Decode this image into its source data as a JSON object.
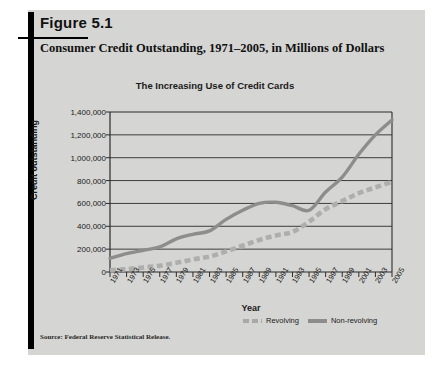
{
  "figure": {
    "label": "Figure 5.1",
    "title": "Consumer Credit Outstanding, 1971–2005, in Millions of Dollars",
    "source": "Source: Federal Reserve Statistical Release."
  },
  "colors": {
    "card_background": "#d5d5d3",
    "non_revolving": "#8d8d8b",
    "revolving": "#aeaeac",
    "axis": "#2b2b2b",
    "text": "#1a1a1a"
  },
  "legend": {
    "position": "bottom-right",
    "entries": [
      {
        "label": "Revolving",
        "style": "dashed"
      },
      {
        "label": "Non-revolving",
        "style": "solid"
      }
    ]
  },
  "chart_data": {
    "type": "line",
    "title": "The Increasing Use of Credit Cards",
    "xlabel": "Year",
    "ylabel": "Credit outstanding",
    "grid": true,
    "ylim": [
      0,
      1400000
    ],
    "ytick_labels": [
      "1,400,000",
      "1,200,000",
      "1,000,000",
      "800,000",
      "600,000",
      "400,000",
      "200,000",
      "0"
    ],
    "ytick_values": [
      1400000,
      1200000,
      1000000,
      800000,
      600000,
      400000,
      200000,
      0
    ],
    "categories": [
      "1971",
      "1973",
      "1975",
      "1977",
      "1979",
      "1981",
      "1983",
      "1985",
      "1987",
      "1989",
      "1991",
      "1993",
      "1995",
      "1997",
      "1999",
      "2001",
      "2003",
      "2005"
    ],
    "series": [
      {
        "name": "Revolving",
        "style": "dashed",
        "values": [
          15000,
          25000,
          40000,
          55000,
          80000,
          110000,
          135000,
          180000,
          230000,
          280000,
          320000,
          350000,
          440000,
          550000,
          620000,
          690000,
          740000,
          790000
        ]
      },
      {
        "name": "Non-revolving",
        "style": "solid",
        "values": [
          120000,
          160000,
          190000,
          220000,
          290000,
          330000,
          360000,
          460000,
          540000,
          600000,
          610000,
          580000,
          540000,
          700000,
          830000,
          1030000,
          1200000,
          1330000
        ]
      }
    ]
  }
}
